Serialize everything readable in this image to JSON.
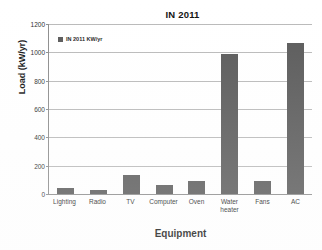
{
  "chart_data": {
    "type": "bar",
    "title": "IN 2011",
    "xlabel": "Equipment",
    "ylabel": "Load (kW/yr)",
    "categories": [
      "Lighting",
      "Radio",
      "TV",
      "Computer",
      "Oven",
      "Water heater",
      "Fans",
      "AC"
    ],
    "series": [
      {
        "name": "IN 2011 KW/yr",
        "values": [
          45,
          25,
          135,
          65,
          95,
          990,
          90,
          1065
        ]
      }
    ],
    "ylim": [
      0,
      1200
    ],
    "ytick_labels": [
      "0",
      "200",
      "400",
      "600",
      "800",
      "1000",
      "1200"
    ],
    "ytick_values": [
      0,
      200,
      400,
      600,
      800,
      1000,
      1200
    ],
    "grid": true,
    "legend_position": "top-left-inside",
    "bar_color": "#595959",
    "gridline_color": "#b9b9b9",
    "axis_color": "#8c8c8c"
  },
  "legend": {
    "label": "IN 2011 KW/yr"
  }
}
